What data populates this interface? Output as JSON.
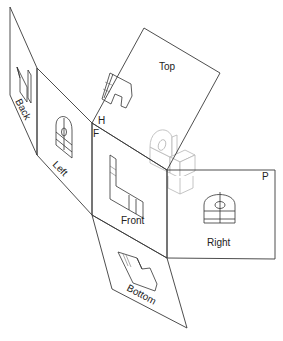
{
  "diagram": {
    "type": "glass-box-unfolded-orthographic-projection",
    "panels": [
      {
        "id": "back",
        "label": "Back"
      },
      {
        "id": "left",
        "label": "Left"
      },
      {
        "id": "front",
        "label": "Front"
      },
      {
        "id": "top",
        "label": "Top"
      },
      {
        "id": "right",
        "label": "Right"
      },
      {
        "id": "bottom",
        "label": "Bottom"
      }
    ],
    "fold_markers": {
      "horizontal_plane": "H",
      "frontal_plane": "F",
      "profile_plane": "P"
    },
    "colors": {
      "lines": "#3a3a3a",
      "isometric_object": "#b5b5b5",
      "background": "#ffffff"
    }
  }
}
